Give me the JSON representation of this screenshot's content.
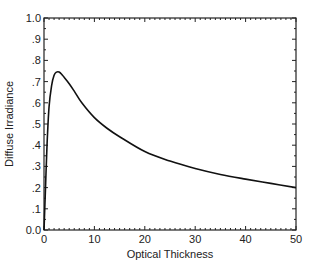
{
  "chart_data": {
    "type": "line",
    "title": "",
    "xlabel": "Optical Thickness",
    "ylabel": "Diffuse Irradiance",
    "xlim": [
      0,
      50
    ],
    "ylim": [
      0.0,
      1.0
    ],
    "grid": false,
    "legend": null,
    "x_ticks": [
      0,
      10,
      20,
      30,
      40,
      50
    ],
    "x_tick_labels": [
      "0",
      "10",
      "20",
      "30",
      "40",
      "50"
    ],
    "y_ticks": [
      0.0,
      0.1,
      0.2,
      0.3,
      0.4,
      0.5,
      0.6,
      0.7,
      0.8,
      0.9,
      1.0
    ],
    "y_tick_labels": [
      "0.0",
      ".1",
      ".2",
      ".3",
      ".4",
      ".5",
      ".6",
      ".7",
      ".8",
      ".9",
      "1.0"
    ],
    "series": [
      {
        "name": "Diffuse Irradiance",
        "color": "#111111",
        "x": [
          0,
          0.3,
          0.6,
          1,
          1.5,
          2,
          2.5,
          3,
          3.5,
          4,
          5,
          6,
          7.5,
          10,
          12.5,
          15,
          20,
          25,
          30,
          35,
          40,
          45,
          50
        ],
        "y": [
          0.0,
          0.2,
          0.4,
          0.58,
          0.68,
          0.73,
          0.745,
          0.745,
          0.735,
          0.72,
          0.69,
          0.655,
          0.6,
          0.53,
          0.48,
          0.44,
          0.37,
          0.325,
          0.29,
          0.262,
          0.24,
          0.22,
          0.2
        ]
      }
    ]
  }
}
